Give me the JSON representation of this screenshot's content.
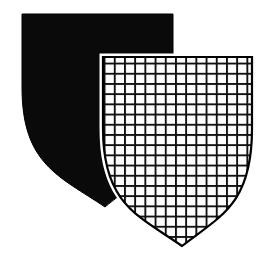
{
  "image": {
    "title": "Two overlapping heraldic shields",
    "width": 271,
    "height": 262,
    "background_color": "#ffffff",
    "ink_color": "#000000",
    "style": "line art, black and white engraving"
  },
  "shields": [
    {
      "id": "back-shield",
      "name": "black-shield",
      "position": "rear-left",
      "tincture_label": "sable",
      "fill_color": "#0a0a0a",
      "stroke_color": "#000000",
      "pattern": "solid",
      "geometry": {
        "top_left_x": 22,
        "top_right_x": 173,
        "top_y": 14,
        "point_x": 105,
        "point_y": 207,
        "left_curve_control_x": 22,
        "left_curve_control_y": 150
      }
    },
    {
      "id": "front-shield",
      "name": "lattice-shield",
      "position": "front-right",
      "tincture_label": "fretty",
      "fill_color": "#ffffff",
      "stroke_color": "#000000",
      "pattern": "grid",
      "grid": {
        "cell_size": 10.2,
        "line_width": 1.9,
        "line_color": "#111111",
        "vertical_lines": 15,
        "horizontal_lines": 19
      },
      "geometry": {
        "top_left_x": 103,
        "top_right_x": 252,
        "top_y": 57,
        "point_x": 182,
        "point_y": 246,
        "left_curve_control_x": 103,
        "left_curve_control_y": 192,
        "right_curve_control_x": 252,
        "right_curve_control_y": 192
      }
    }
  ]
}
